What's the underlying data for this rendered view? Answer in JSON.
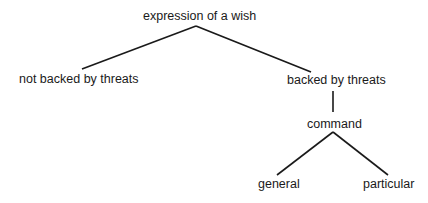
{
  "diagram": {
    "type": "tree",
    "nodes": {
      "root": {
        "label": "expression of a wish"
      },
      "not_backed": {
        "label": "not backed by threats"
      },
      "backed": {
        "label": "backed by threats"
      },
      "command": {
        "label": "command"
      },
      "general": {
        "label": "general"
      },
      "particular": {
        "label": "particular"
      }
    },
    "edges": [
      {
        "from": "expression of a wish",
        "to": "not backed by threats"
      },
      {
        "from": "expression of a wish",
        "to": "backed by threats"
      },
      {
        "from": "backed by threats",
        "to": "command"
      },
      {
        "from": "command",
        "to": "general"
      },
      {
        "from": "command",
        "to": "particular"
      }
    ]
  }
}
